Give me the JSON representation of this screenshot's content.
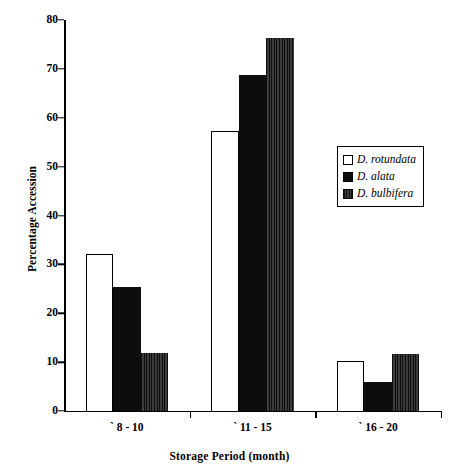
{
  "chart_data": {
    "type": "bar",
    "title": "",
    "xlabel": "Storage Period (month)",
    "ylabel": "Percentage Accession",
    "categories": [
      "` 8 - 10",
      "` 11 - 15",
      "` 16 - 20"
    ],
    "series": [
      {
        "name": "D. rotundata",
        "values": [
          32.2,
          57.2,
          10.3
        ],
        "color": "#ffffff",
        "swatch": "open-square"
      },
      {
        "name": "D. alata",
        "values": [
          25.4,
          68.7,
          5.9
        ],
        "color": "#0d0d0d",
        "swatch": "filled-black-square"
      },
      {
        "name": "D. bulbifera",
        "values": [
          11.9,
          76.3,
          11.7
        ],
        "color": "#2b2b2b",
        "swatch": "hatched-dark-square"
      }
    ],
    "ylim": [
      0,
      80
    ],
    "yticks": [
      0,
      10,
      20,
      30,
      40,
      50,
      60,
      70,
      80
    ],
    "ytick_labels": [
      "0",
      "10",
      "20",
      "30",
      "40",
      "50",
      "60",
      "70",
      "80"
    ],
    "grid": false,
    "legend_position": "center-right",
    "legend_entries": [
      "D. rotundata",
      "D. alata",
      "D. bulbifera"
    ]
  }
}
